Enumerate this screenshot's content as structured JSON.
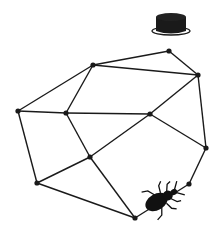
{
  "diagram": {
    "type": "graph",
    "line_color": "#1a1a1a",
    "node_color": "#1a1a1a",
    "nodes": [
      {
        "id": "A",
        "x": 169,
        "y": 51
      },
      {
        "id": "B",
        "x": 93,
        "y": 65
      },
      {
        "id": "C",
        "x": 198,
        "y": 75
      },
      {
        "id": "D",
        "x": 18,
        "y": 111
      },
      {
        "id": "E",
        "x": 66,
        "y": 113
      },
      {
        "id": "F",
        "x": 150,
        "y": 114
      },
      {
        "id": "G",
        "x": 90,
        "y": 157
      },
      {
        "id": "H",
        "x": 206,
        "y": 148
      },
      {
        "id": "I",
        "x": 37,
        "y": 183
      },
      {
        "id": "J",
        "x": 135,
        "y": 218
      },
      {
        "id": "K",
        "x": 189,
        "y": 184
      }
    ],
    "edges": [
      [
        "A",
        "B"
      ],
      [
        "A",
        "C"
      ],
      [
        "B",
        "C"
      ],
      [
        "B",
        "D"
      ],
      [
        "B",
        "E"
      ],
      [
        "D",
        "E"
      ],
      [
        "E",
        "F"
      ],
      [
        "C",
        "F"
      ],
      [
        "C",
        "H"
      ],
      [
        "D",
        "I"
      ],
      [
        "E",
        "G"
      ],
      [
        "F",
        "G"
      ],
      [
        "F",
        "H"
      ],
      [
        "G",
        "I"
      ],
      [
        "G",
        "J"
      ],
      [
        "I",
        "J"
      ],
      [
        "H",
        "K"
      ],
      [
        "K",
        "J"
      ]
    ],
    "icons": [
      {
        "name": "puck-icon",
        "x": 171,
        "y": 13
      },
      {
        "name": "beetle-icon",
        "x": 160,
        "y": 200
      }
    ]
  }
}
